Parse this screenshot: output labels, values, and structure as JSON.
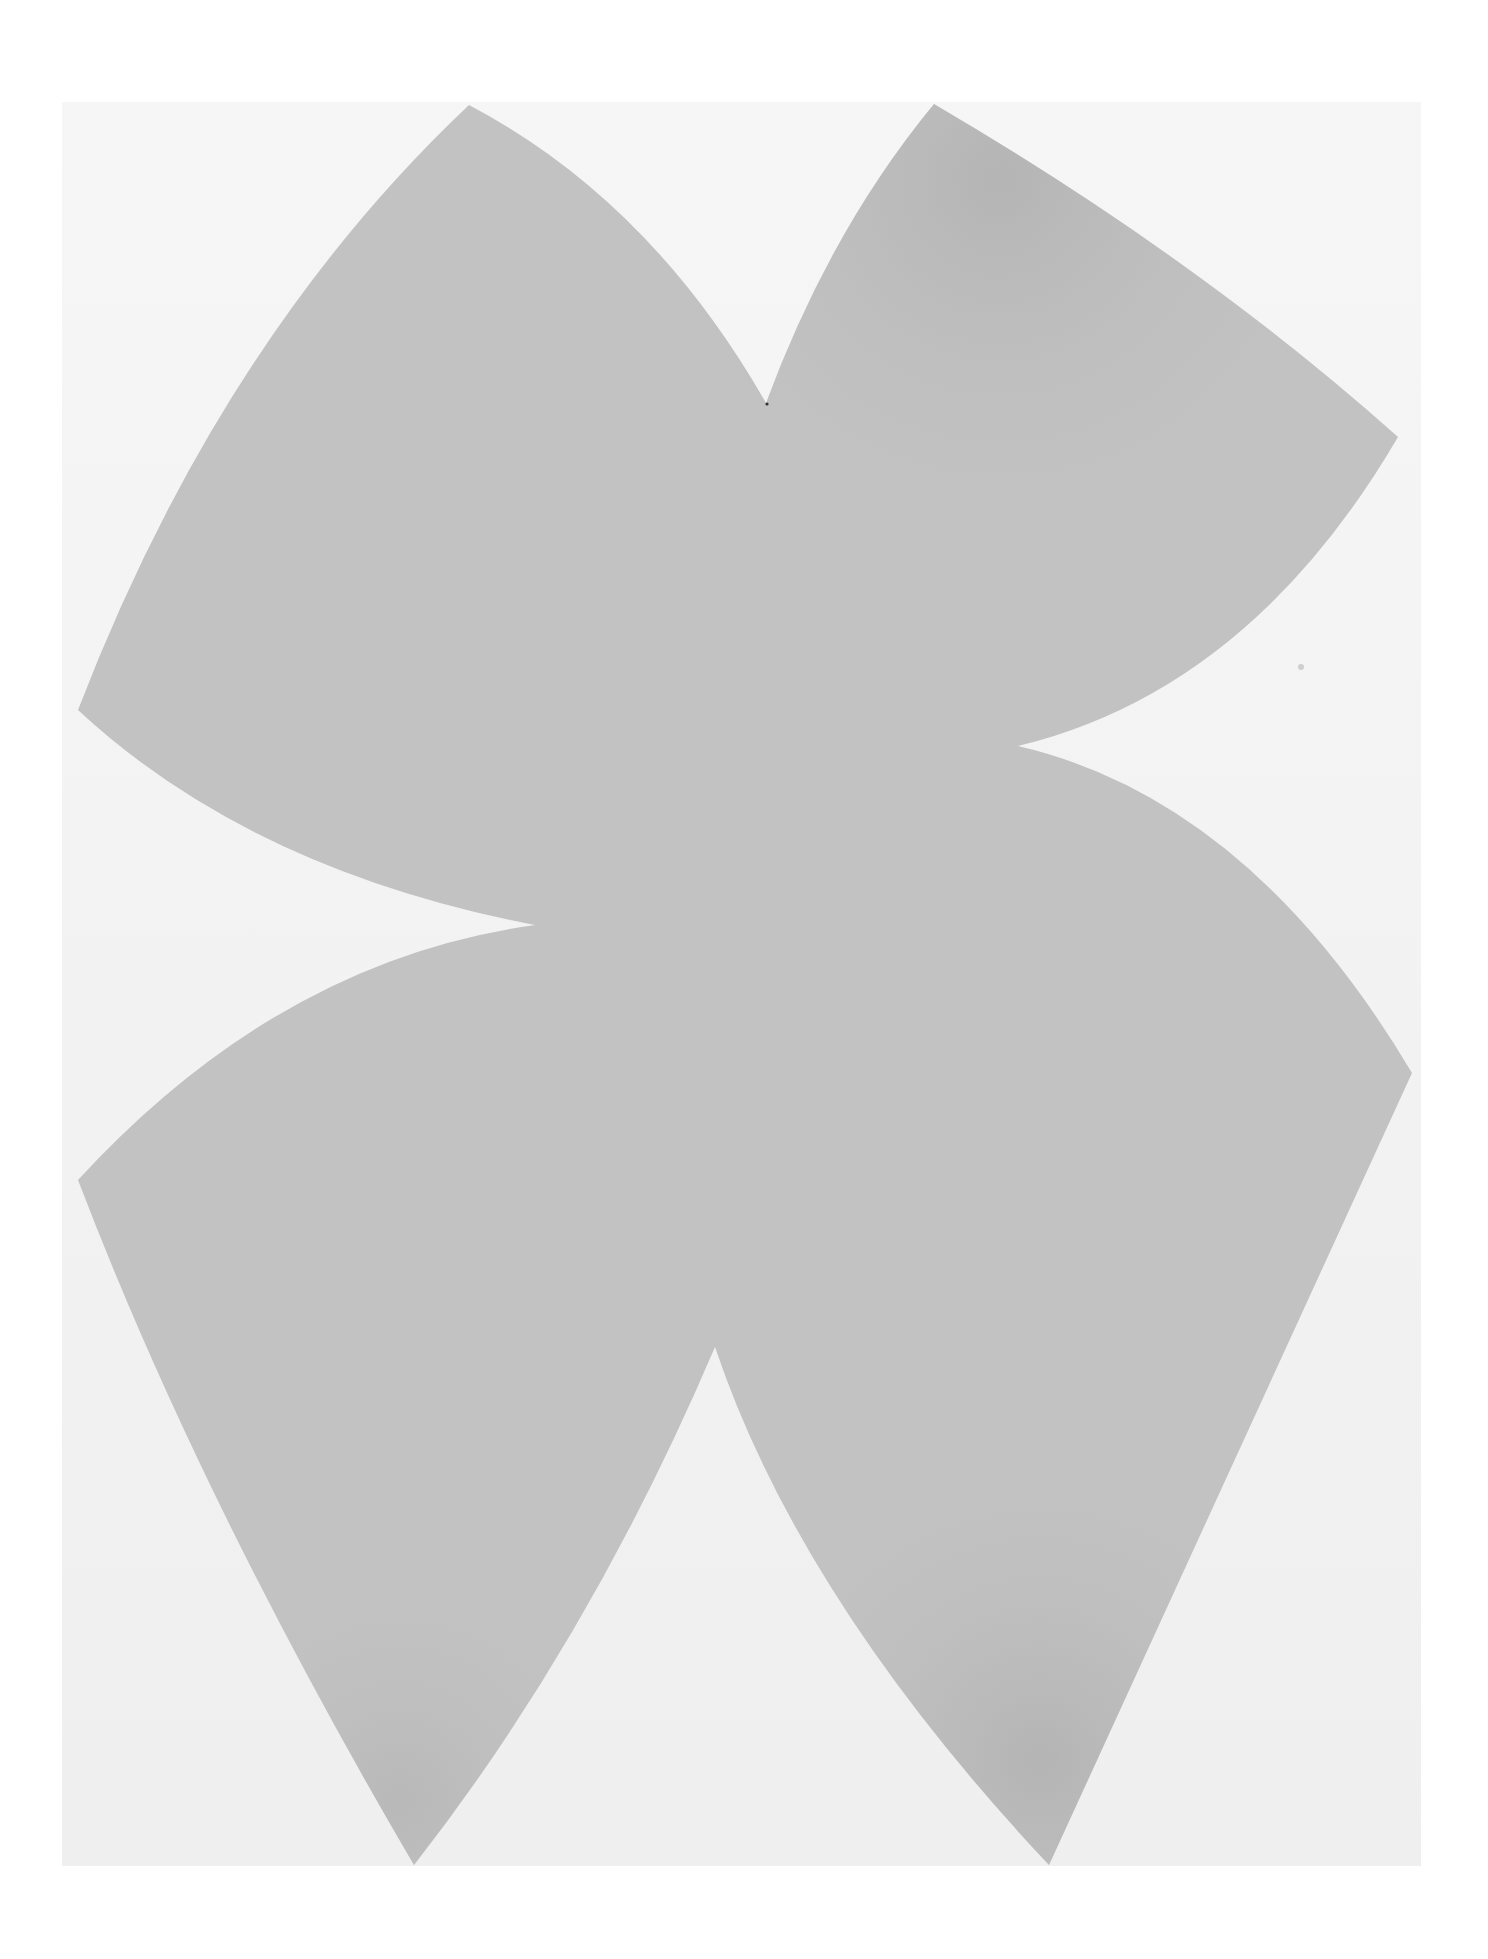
{
  "artwork": {
    "description": "Gray four-lobed organic shape with curved notches on an off-white canvas",
    "colors": {
      "page_background": "#ffffff",
      "canvas": "#f3f3f3",
      "shape_fill": "#c2c2c2",
      "shape_shadow": "#b0b0b0"
    },
    "canvas_bounds": {
      "x": 62,
      "y": 102,
      "width": 1359,
      "height": 1764
    }
  }
}
